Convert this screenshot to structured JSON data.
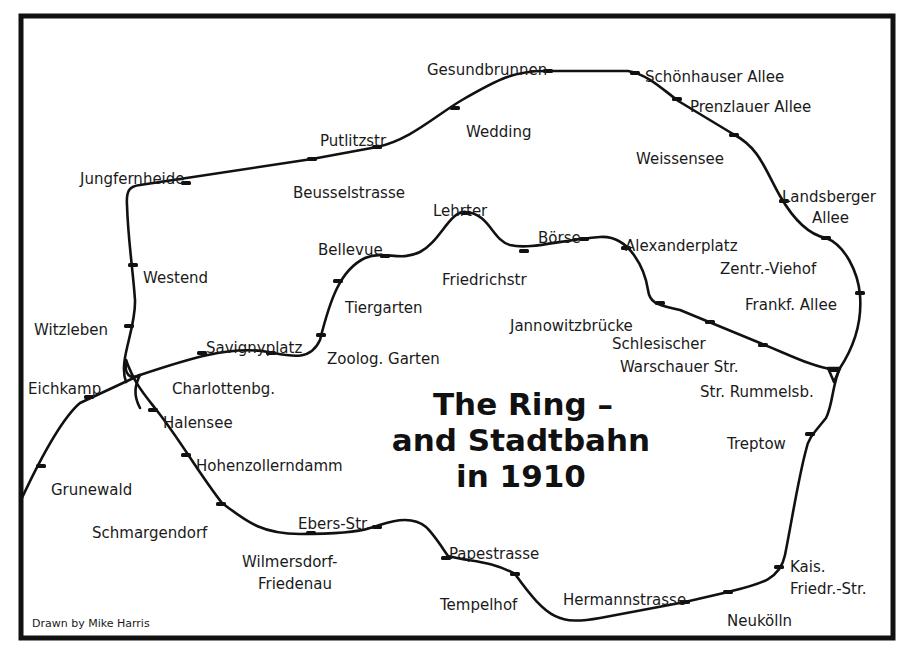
{
  "map": {
    "title_lines": [
      "The Ring –",
      "and Stadtbahn",
      "in 1910"
    ],
    "credit": "Drawn by Mike Harris",
    "colors": {
      "line": "#111111",
      "text": "#1a1a1a",
      "background": "#ffffff"
    }
  },
  "stations": {
    "ring": [
      {
        "name": "Gesundbrunnen",
        "x": 427,
        "y": 63,
        "mx": 548,
        "my": 71
      },
      {
        "name": "Schönhauser Allee",
        "x": 645,
        "y": 70,
        "mx": 635,
        "my": 73
      },
      {
        "name": "Prenzlauer Allee",
        "x": 690,
        "y": 100,
        "mx": 677,
        "my": 99
      },
      {
        "name": "Weissensee",
        "x": 636,
        "y": 152,
        "mx": 734,
        "my": 135
      },
      {
        "name": "Landsberger",
        "x": 782,
        "y": 190,
        "mx": 784,
        "my": 201
      },
      {
        "name": "Allee",
        "x": 812,
        "y": 211,
        "mx": null,
        "my": null
      },
      {
        "name": "Zentr.-Viehof",
        "x": 720,
        "y": 262,
        "mx": 826,
        "my": 238
      },
      {
        "name": "Frankf. Allee",
        "x": 745,
        "y": 298,
        "mx": 860,
        "my": 293
      },
      {
        "name": "Str. Rummelsb.",
        "x": 700,
        "y": 385,
        "mx": 835,
        "my": 370
      },
      {
        "name": "Treptow",
        "x": 727,
        "y": 437,
        "mx": 810,
        "my": 434
      },
      {
        "name": "Kais.",
        "x": 790,
        "y": 560,
        "mx": null,
        "my": null
      },
      {
        "name": "Friedr.-Str.",
        "x": 790,
        "y": 582,
        "mx": 779,
        "my": 567
      },
      {
        "name": "Neukölln",
        "x": 727,
        "y": 614,
        "mx": 728,
        "my": 592
      },
      {
        "name": "Hermannstrasse",
        "x": 563,
        "y": 593,
        "mx": 685,
        "my": 602
      },
      {
        "name": "Tempelhof",
        "x": 440,
        "y": 598,
        "mx": 515,
        "my": 574
      },
      {
        "name": "Papestrasse",
        "x": 449,
        "y": 547,
        "mx": 446,
        "my": 558
      },
      {
        "name": "Ebers-Str.",
        "x": 298,
        "y": 517,
        "mx": 377,
        "my": 527
      },
      {
        "name": "Wilmersdorf-",
        "x": 242,
        "y": 555,
        "mx": 311,
        "my": 533
      },
      {
        "name": "Friedenau",
        "x": 258,
        "y": 577,
        "mx": null,
        "my": null
      },
      {
        "name": "Schmargendorf",
        "x": 92,
        "y": 526,
        "mx": 221,
        "my": 504
      },
      {
        "name": "Hohenzollerndamm",
        "x": 196,
        "y": 459,
        "mx": 186,
        "my": 455
      },
      {
        "name": "Halensee",
        "x": 163,
        "y": 416,
        "mx": 153,
        "my": 410
      },
      {
        "name": "Witzleben",
        "x": 34,
        "y": 323,
        "mx": 129,
        "my": 326
      },
      {
        "name": "Westend",
        "x": 143,
        "y": 271,
        "mx": 133,
        "my": 265
      },
      {
        "name": "Jungfernheide",
        "x": 80,
        "y": 172,
        "mx": 186,
        "my": 183
      },
      {
        "name": "Beusselstrasse",
        "x": 293,
        "y": 186,
        "mx": 312,
        "my": 159
      },
      {
        "name": "Putlitzstr",
        "x": 320,
        "y": 134,
        "mx": 377,
        "my": 147
      },
      {
        "name": "Wedding",
        "x": 466,
        "y": 125,
        "mx": 455,
        "my": 108
      }
    ],
    "stadtbahn": [
      {
        "name": "Lehrter",
        "x": 433,
        "y": 204,
        "mx": 466,
        "my": 213
      },
      {
        "name": "Bellevue",
        "x": 318,
        "y": 243,
        "mx": 385,
        "my": 256
      },
      {
        "name": "Friedrichstr",
        "x": 442,
        "y": 273,
        "mx": 524,
        "my": 251
      },
      {
        "name": "Börse",
        "x": 538,
        "y": 231,
        "mx": 584,
        "my": 239
      },
      {
        "name": "Alexanderplatz",
        "x": 625,
        "y": 239,
        "mx": 626,
        "my": 248
      },
      {
        "name": "Tiergarten",
        "x": 345,
        "y": 301,
        "mx": 338,
        "my": 281
      },
      {
        "name": "Jannowitzbrücke",
        "x": 510,
        "y": 319,
        "mx": 660,
        "my": 303
      },
      {
        "name": "Schlesischer",
        "x": 612,
        "y": 337,
        "mx": 710,
        "my": 322
      },
      {
        "name": "Warschauer Str.",
        "x": 620,
        "y": 360,
        "mx": 763,
        "my": 345
      },
      {
        "name": "Zoolog. Garten",
        "x": 327,
        "y": 352,
        "mx": 321,
        "my": 335
      },
      {
        "name": "Savignyplatz",
        "x": 206,
        "y": 341,
        "mx": 271,
        "my": 353
      },
      {
        "name": "Charlottenbg.",
        "x": 172,
        "y": 382,
        "mx": 202,
        "my": 353
      },
      {
        "name": "Eichkamp",
        "x": 28,
        "y": 382,
        "mx": 89,
        "my": 397
      },
      {
        "name": "Grunewald",
        "x": 51,
        "y": 483,
        "mx": 41,
        "my": 466
      }
    ]
  }
}
